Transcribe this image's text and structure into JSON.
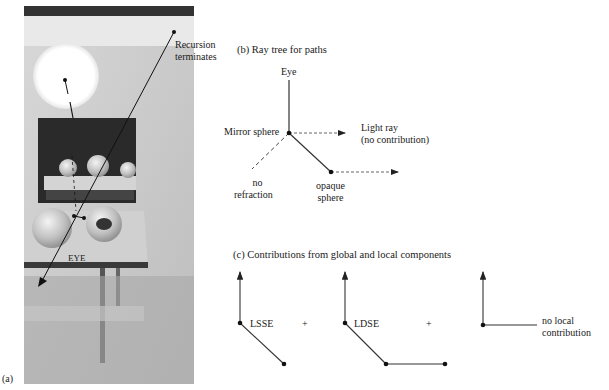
{
  "panel_a": {
    "label": "(a)",
    "annotations": {
      "recursion_terminates_line1": "Recursion",
      "recursion_terminates_line2": "terminates",
      "eye": "EYE"
    }
  },
  "panel_b": {
    "title": "(b) Ray tree for paths",
    "nodes": {
      "eye": "Eye",
      "mirror_sphere": "Mirror sphere",
      "light_ray_line1": "Light ray",
      "light_ray_line2": "(no contribution)",
      "no_refraction_line1": "no",
      "no_refraction_line2": "refraction",
      "opaque_sphere_line1": "opaque",
      "opaque_sphere_line2": "sphere"
    }
  },
  "panel_c": {
    "title": "(c) Contributions from global and local components",
    "terms": [
      {
        "label": "LSSE"
      },
      {
        "label": "LDSE"
      },
      {
        "label_line1": "no local",
        "label_line2": "contribution"
      }
    ],
    "operators": [
      "+",
      "+"
    ]
  },
  "colors": {
    "line": "#222222",
    "dashed": "#555555",
    "background": "#ffffff"
  }
}
